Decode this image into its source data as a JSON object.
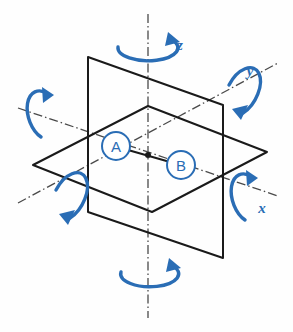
{
  "figure": {
    "colors": {
      "accent_blue": "#2a6db5",
      "line_black": "#1a1a1a",
      "axis_gray": "#4a4a4a",
      "background": "#fefefe",
      "node_fill": "#ffffff"
    }
  },
  "axes": [
    {
      "id": "z",
      "label": "z",
      "label_x": 180,
      "label_y": 45,
      "orientation": "vertical"
    },
    {
      "id": "y",
      "label": "y",
      "label_x": 250,
      "label_y": 71,
      "orientation": "diagonal-up-right"
    },
    {
      "id": "x",
      "label": "x",
      "label_x": 262,
      "label_y": 208,
      "orientation": "diagonal-down-right"
    }
  ],
  "nodes": [
    {
      "id": "A",
      "label": "A",
      "cx": 116,
      "cy": 146,
      "r": 14
    },
    {
      "id": "B",
      "label": "B",
      "cx": 181,
      "cy": 165,
      "r": 14
    }
  ],
  "rotation_arrows": [
    {
      "id": "z-top",
      "axis": "z",
      "position": "top",
      "labeled": true
    },
    {
      "id": "z-bottom",
      "axis": "z",
      "position": "bottom",
      "labeled": false
    },
    {
      "id": "y-upper-right",
      "axis": "y",
      "position": "upper-right",
      "labeled": true
    },
    {
      "id": "y-lower-left",
      "axis": "y",
      "position": "lower-left",
      "labeled": false
    },
    {
      "id": "x-right",
      "axis": "x",
      "position": "right",
      "labeled": true
    },
    {
      "id": "x-left",
      "axis": "x",
      "position": "left",
      "labeled": false
    }
  ],
  "planes": [
    {
      "id": "horizontal-plane",
      "shape": "parallelogram"
    },
    {
      "id": "vertical-plane",
      "shape": "parallelogram"
    }
  ],
  "origin": {
    "x": 148,
    "y": 155
  }
}
